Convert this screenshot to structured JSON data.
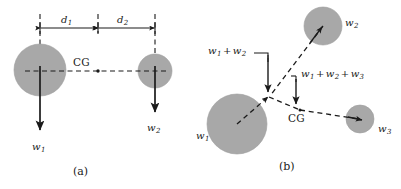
{
  "figure": {
    "title_a": "(a)",
    "title_b": "(b)",
    "colors": {
      "mass_fill": "#a8a8a8",
      "mass_stroke": "#9a9a9a",
      "line": "#1a1a1a",
      "background": "#ffffff"
    }
  },
  "panel_a": {
    "caption": "(a)",
    "dimension_labels": [
      {
        "symbol": "d",
        "subscript": "1"
      },
      {
        "symbol": "d",
        "subscript": "2"
      }
    ],
    "weights": [
      {
        "symbol": "w",
        "subscript": "1"
      },
      {
        "symbol": "w",
        "subscript": "2"
      }
    ],
    "cg_label": "CG",
    "masses": [
      {
        "name": "mass-1",
        "cx": 40,
        "cy": 70,
        "r": 26
      },
      {
        "name": "mass-2",
        "cx": 155,
        "cy": 71,
        "r": 17
      }
    ]
  },
  "panel_b": {
    "caption": "(b)",
    "cg_label": "CG",
    "weights": [
      {
        "symbol": "w",
        "subscript": "1"
      },
      {
        "symbol": "w",
        "subscript": "2"
      },
      {
        "symbol": "w",
        "subscript": "3"
      }
    ],
    "resultant_12": {
      "terms": [
        {
          "symbol": "w",
          "subscript": "1"
        },
        {
          "symbol": "w",
          "subscript": "2"
        }
      ],
      "operator": "+"
    },
    "resultant_123": {
      "terms": [
        {
          "symbol": "w",
          "subscript": "1"
        },
        {
          "symbol": "w",
          "subscript": "2"
        },
        {
          "symbol": "w",
          "subscript": "3"
        }
      ],
      "operator": "+"
    },
    "masses": [
      {
        "name": "mass-1",
        "cx": 237,
        "cy": 124,
        "r": 30
      },
      {
        "name": "mass-2",
        "cx": 323,
        "cy": 26,
        "r": 19
      },
      {
        "name": "mass-3",
        "cx": 360,
        "cy": 119,
        "r": 14
      }
    ]
  }
}
